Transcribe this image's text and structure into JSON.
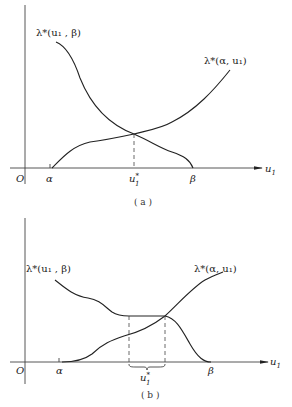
{
  "figure_a": {
    "caption": "( a )",
    "origin_label": "O",
    "x_axis_label": "u",
    "x_axis_sub": "1",
    "curve_left_label": "λ*(u₁ , β)",
    "curve_right_label": "λ*(α, u₁)",
    "tick_alpha": "α",
    "tick_beta": "β",
    "tick_ustar": "u",
    "tick_ustar_sup": "*",
    "tick_ustar_sub": "1"
  },
  "figure_b": {
    "caption": "( b )",
    "origin_label": "O",
    "x_axis_label": "u",
    "x_axis_sub": "1",
    "curve_left_label": "λ*(u₁ , β)",
    "curve_right_label": "λ*(α, u₁)",
    "tick_alpha": "α",
    "tick_beta": "β",
    "tick_ustar": "u",
    "tick_ustar_sup": "*",
    "tick_ustar_sub": "1"
  }
}
